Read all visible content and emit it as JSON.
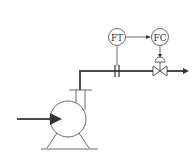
{
  "diagram": {
    "type": "P&ID flow control loop",
    "instruments": [
      {
        "id": "ft",
        "label": "FT",
        "meaning": "flow transmitter"
      },
      {
        "id": "fc",
        "label": "FC",
        "meaning": "flow controller"
      }
    ],
    "equipment": [
      {
        "id": "pump",
        "name": "centrifugal-pump"
      },
      {
        "id": "orifice",
        "name": "orifice-plate"
      },
      {
        "id": "control-valve",
        "name": "control-valve"
      }
    ],
    "flow": {
      "inlet": "pump suction",
      "outlet": "discharge arrow right"
    },
    "colors": {
      "line": "#6a6a6a",
      "pipe": "#4a4a4a",
      "background": "#ffffff"
    }
  }
}
